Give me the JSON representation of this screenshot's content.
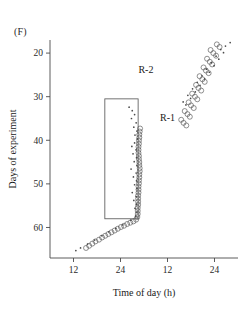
{
  "panel": {
    "label": "(F)"
  },
  "chart_data": {
    "type": "scatter",
    "title": "(F)",
    "subtitle": "",
    "xlabel": "Time of day (h)",
    "ylabel": "Days of experiment",
    "grid": false,
    "double_plotted": true,
    "xlim": [
      6,
      54
    ],
    "ylim": [
      17,
      67
    ],
    "y_inverted": true,
    "xticks": [
      12,
      24,
      36,
      48
    ],
    "xticklabels": [
      "12",
      "24",
      "12",
      "24"
    ],
    "yticks": [
      20,
      30,
      40,
      50,
      60
    ],
    "yticklabels": [
      "20",
      "30",
      "40",
      "50",
      "60"
    ],
    "annotations": [
      {
        "text": "R-2",
        "x": 30.5,
        "y": 24.5
      },
      {
        "text": "R-1",
        "x": 36.0,
        "y": 35.5
      }
    ],
    "shapes": [
      {
        "kind": "rect",
        "name": "treatment-window",
        "x0": 20.0,
        "x1": 28.5,
        "y0": 30.5,
        "y1": 58.0
      }
    ],
    "series": [
      {
        "name": "R-1",
        "marker": "open-circle",
        "color": "#555555",
        "points": [
          [
            48.6,
            18.0
          ],
          [
            49.3,
            18.6
          ],
          [
            47.0,
            19.3
          ],
          [
            47.7,
            20.0
          ],
          [
            48.4,
            20.6
          ],
          [
            46.1,
            21.3
          ],
          [
            46.8,
            22.0
          ],
          [
            47.4,
            22.6
          ],
          [
            45.2,
            23.3
          ],
          [
            45.8,
            24.0
          ],
          [
            46.5,
            24.6
          ],
          [
            44.2,
            25.3
          ],
          [
            44.9,
            26.0
          ],
          [
            45.5,
            26.6
          ],
          [
            43.3,
            27.3
          ],
          [
            43.9,
            28.0
          ],
          [
            44.6,
            28.6
          ],
          [
            42.3,
            29.3
          ],
          [
            43.0,
            30.0
          ],
          [
            43.6,
            30.6
          ],
          [
            41.4,
            31.3
          ],
          [
            42.0,
            32.0
          ],
          [
            42.7,
            32.6
          ],
          [
            40.4,
            33.3
          ],
          [
            41.1,
            34.0
          ],
          [
            41.7,
            34.6
          ],
          [
            39.5,
            35.3
          ],
          [
            40.1,
            36.0
          ],
          [
            40.8,
            36.6
          ],
          [
            29.0,
            37.3
          ],
          [
            28.9,
            38.0
          ],
          [
            28.8,
            38.7
          ],
          [
            28.8,
            39.4
          ],
          [
            28.7,
            40.1
          ],
          [
            28.7,
            40.8
          ],
          [
            28.6,
            41.5
          ],
          [
            28.6,
            42.2
          ],
          [
            28.6,
            42.9
          ],
          [
            28.7,
            43.6
          ],
          [
            28.7,
            44.3
          ],
          [
            28.8,
            45.0
          ],
          [
            28.8,
            45.7
          ],
          [
            28.9,
            46.4
          ],
          [
            28.9,
            47.1
          ],
          [
            28.8,
            47.8
          ],
          [
            28.8,
            48.5
          ],
          [
            28.7,
            49.2
          ],
          [
            28.7,
            49.9
          ],
          [
            28.6,
            50.6
          ],
          [
            28.6,
            51.3
          ],
          [
            28.6,
            52.0
          ],
          [
            28.5,
            52.7
          ],
          [
            28.5,
            53.4
          ],
          [
            28.5,
            54.1
          ],
          [
            28.5,
            54.8
          ],
          [
            28.4,
            55.5
          ],
          [
            28.4,
            56.2
          ],
          [
            28.4,
            56.9
          ],
          [
            28.3,
            57.6
          ],
          [
            28.0,
            58.2
          ],
          [
            27.3,
            58.6
          ],
          [
            26.5,
            58.9
          ],
          [
            25.7,
            59.2
          ],
          [
            24.9,
            59.6
          ],
          [
            24.1,
            59.9
          ],
          [
            23.3,
            60.3
          ],
          [
            22.5,
            60.7
          ],
          [
            21.7,
            61.1
          ],
          [
            20.9,
            61.5
          ],
          [
            20.1,
            61.9
          ],
          [
            19.3,
            62.3
          ],
          [
            18.5,
            62.8
          ],
          [
            17.6,
            63.2
          ],
          [
            16.8,
            63.7
          ],
          [
            16.0,
            64.2
          ],
          [
            15.2,
            64.7
          ]
        ]
      },
      {
        "name": "R-2",
        "marker": "dot",
        "color": "#4a4a4a",
        "points": [
          [
            52.0,
            17.6
          ],
          [
            50.8,
            18.4
          ],
          [
            49.6,
            19.2
          ],
          [
            50.3,
            19.9
          ],
          [
            48.4,
            20.7
          ],
          [
            49.1,
            21.4
          ],
          [
            47.2,
            22.2
          ],
          [
            47.9,
            22.9
          ],
          [
            46.0,
            23.7
          ],
          [
            46.7,
            24.4
          ],
          [
            44.8,
            25.2
          ],
          [
            45.5,
            25.9
          ],
          [
            43.6,
            26.7
          ],
          [
            44.3,
            27.4
          ],
          [
            42.4,
            28.2
          ],
          [
            43.1,
            28.9
          ],
          [
            41.2,
            29.7
          ],
          [
            41.9,
            30.4
          ],
          [
            40.0,
            31.2
          ],
          [
            40.7,
            31.9
          ],
          [
            26.2,
            32.4
          ],
          [
            27.0,
            33.2
          ],
          [
            27.6,
            34.1
          ],
          [
            26.8,
            35.0
          ],
          [
            28.0,
            36.0
          ],
          [
            27.4,
            37.0
          ],
          [
            28.2,
            37.9
          ],
          [
            27.7,
            38.8
          ],
          [
            28.3,
            39.7
          ],
          [
            27.6,
            40.6
          ],
          [
            26.9,
            41.4
          ],
          [
            28.0,
            42.2
          ],
          [
            27.2,
            43.1
          ],
          [
            28.1,
            44.0
          ],
          [
            27.5,
            44.9
          ],
          [
            28.2,
            45.8
          ],
          [
            26.7,
            46.6
          ],
          [
            28.0,
            47.5
          ],
          [
            27.3,
            48.4
          ],
          [
            28.1,
            49.3
          ],
          [
            27.6,
            50.2
          ],
          [
            28.2,
            51.1
          ],
          [
            27.0,
            52.0
          ],
          [
            28.0,
            52.9
          ],
          [
            27.4,
            53.8
          ],
          [
            28.1,
            54.7
          ],
          [
            27.7,
            55.6
          ],
          [
            28.2,
            56.5
          ],
          [
            27.9,
            57.4
          ],
          [
            26.6,
            58.3
          ],
          [
            24.6,
            59.4
          ],
          [
            22.8,
            60.2
          ],
          [
            21.0,
            61.0
          ],
          [
            19.2,
            61.9
          ],
          [
            17.4,
            62.9
          ],
          [
            15.6,
            63.8
          ],
          [
            13.8,
            64.7
          ],
          [
            12.6,
            65.3
          ]
        ]
      }
    ]
  }
}
